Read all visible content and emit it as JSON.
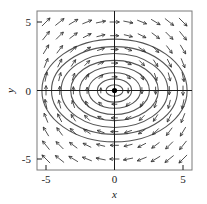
{
  "chart_data": {
    "type": "scatter",
    "plot_kind": "phase-portrait-vector-field",
    "title": "",
    "subtitle": "",
    "xlabel": "x",
    "ylabel": "y",
    "xlim": [
      -5.6,
      5.6
    ],
    "ylim": [
      -5.6,
      5.6
    ],
    "x_ticks": [
      -5,
      0,
      5
    ],
    "x_tick_labels": [
      "-5",
      "0",
      "5"
    ],
    "y_ticks": [
      -5,
      0,
      5
    ],
    "y_tick_labels": [
      "-5",
      "0",
      "5"
    ],
    "grid": false,
    "legend": null,
    "frame": true,
    "annotations": [
      {
        "kind": "fixed-point",
        "label": "center",
        "x": 0,
        "y": 0,
        "marker": "filled-circle",
        "color": "#000000"
      }
    ],
    "vector_field": {
      "description": "Clockwise rotational flow about the origin; arrows point in +x direction above the x-axis and -x direction below it.",
      "system": "dx/dt = y, dy/dt = -x (elliptical center)",
      "direction": "clockwise",
      "arrow_grid_nx": 11,
      "arrow_grid_ny": 11,
      "arrow_grid_x": [
        -5,
        -4,
        -3,
        -2,
        -1,
        0,
        1,
        2,
        3,
        4,
        5
      ],
      "arrow_grid_y": [
        -5,
        -4,
        -3,
        -2,
        -1,
        0,
        1,
        2,
        3,
        4,
        5
      ],
      "arrow_color": "#333333"
    },
    "series": [
      {
        "name": "orbits",
        "kind": "closed-elliptical-trajectories",
        "color": "#555555",
        "count": 8,
        "semi_axis_x": [
          0.62,
          1.25,
          1.9,
          2.55,
          3.2,
          3.9,
          4.6,
          5.3
        ],
        "semi_axis_y": [
          0.42,
          0.85,
          1.3,
          1.75,
          2.2,
          2.7,
          3.2,
          3.75
        ]
      }
    ]
  },
  "figure": {
    "axis_x_label": "x",
    "axis_y_label": "y",
    "x_tick_neg5": "-5",
    "x_tick_zero": "0",
    "x_tick_pos5": "5",
    "y_tick_neg5": "-5",
    "y_tick_zero": "0",
    "y_tick_pos5": "5",
    "background_color": "#ffffff",
    "frame_color": "#7a7a7a",
    "axis_color": "#1a1a1a",
    "orbit_color": "#555555",
    "arrow_color": "#333333"
  }
}
